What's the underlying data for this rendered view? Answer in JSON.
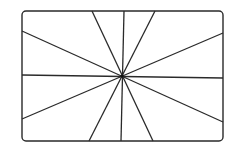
{
  "diagram": {
    "stroke_color": "#2a2a2a",
    "background": "#ffffff",
    "frame": {
      "x": 22,
      "y": 11,
      "width": 201,
      "height": 130,
      "radius": 4
    },
    "center": {
      "x": 122,
      "y": 76
    },
    "rays": [
      {
        "x1": 92,
        "y1": 11,
        "x2": 153,
        "y2": 141
      },
      {
        "x1": 124,
        "y1": 11,
        "x2": 121,
        "y2": 141
      },
      {
        "x1": 155,
        "y1": 11,
        "x2": 89,
        "y2": 141
      },
      {
        "x1": 22,
        "y1": 31,
        "x2": 223,
        "y2": 122
      },
      {
        "x1": 22,
        "y1": 75,
        "x2": 223,
        "y2": 78
      },
      {
        "x1": 22,
        "y1": 119,
        "x2": 223,
        "y2": 33
      }
    ]
  }
}
